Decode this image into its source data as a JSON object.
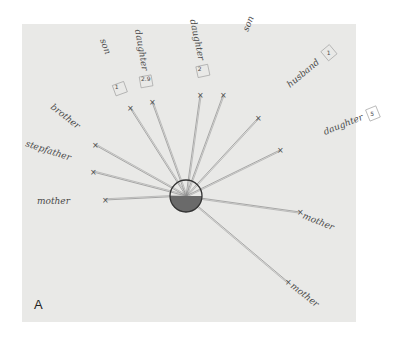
{
  "figure": {
    "label": "A",
    "paper_color": "#e9e9e7",
    "ink_color": "#4a4a4a"
  },
  "center": {
    "name": "self",
    "x": 186,
    "y": 196,
    "r": 16
  },
  "nodes": [
    {
      "id": "son-1",
      "label": "son",
      "tag": "1",
      "x": 130,
      "y": 108,
      "lx": 100,
      "ly": 40,
      "rot": 70
    },
    {
      "id": "daughter-1",
      "label": "daughter",
      "tag": "2.9",
      "x": 152,
      "y": 102,
      "lx": 135,
      "ly": 30,
      "rot": 80
    },
    {
      "id": "daughter-2",
      "label": "daughter",
      "tag": "2",
      "x": 200,
      "y": 95,
      "lx": 190,
      "ly": 20,
      "rot": 78
    },
    {
      "id": "son-2",
      "label": "son",
      "tag": "8",
      "x": 223,
      "y": 95,
      "lx": 248,
      "ly": 32,
      "rot": -68
    },
    {
      "id": "husband",
      "label": "husband",
      "tag": "1",
      "x": 258,
      "y": 118,
      "lx": 290,
      "ly": 88,
      "rot": -40
    },
    {
      "id": "daughter-3",
      "label": "daughter",
      "tag": "5",
      "x": 280,
      "y": 150,
      "lx": 325,
      "ly": 135,
      "rot": -22
    },
    {
      "id": "brother",
      "label": "brother",
      "tag": "",
      "x": 95,
      "y": 145,
      "lx": 50,
      "ly": 108,
      "rot": 38
    },
    {
      "id": "stepfather",
      "label": "stepfather",
      "tag": "",
      "x": 93,
      "y": 172,
      "lx": 25,
      "ly": 146,
      "rot": 18
    },
    {
      "id": "mother",
      "label": "mother",
      "tag": "",
      "x": 105,
      "y": 200,
      "lx": 37,
      "ly": 204,
      "rot": 0
    },
    {
      "id": "mother-in-law",
      "label": "mother",
      "tag": "",
      "x": 300,
      "y": 212,
      "lx": 302,
      "ly": 218,
      "rot": 22
    },
    {
      "id": "mother-2",
      "label": "mother",
      "tag": "",
      "x": 288,
      "y": 282,
      "lx": 290,
      "ly": 287,
      "rot": 38
    }
  ]
}
